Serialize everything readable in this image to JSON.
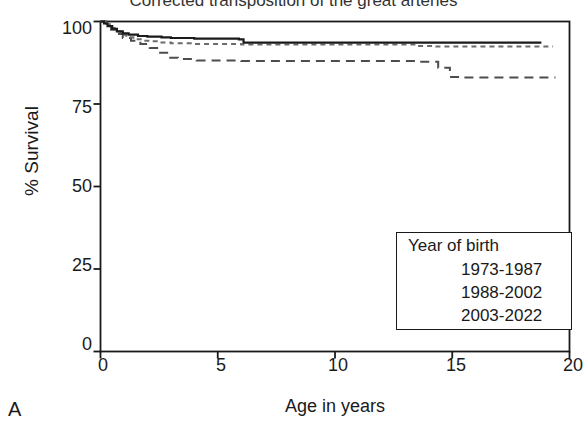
{
  "figure": {
    "panel_label": "A",
    "title": "Corrected transposition of the great arteries"
  },
  "chart_data": {
    "type": "line",
    "title": "Corrected transposition of the great arteries",
    "subtype": "kaplan-meier-survival",
    "xlabel": "Age in years",
    "ylabel": "% Survival",
    "xlim": [
      0,
      20
    ],
    "ylim": [
      0,
      100
    ],
    "xticks": [
      0,
      5,
      10,
      15,
      20
    ],
    "yticks": [
      0,
      25,
      50,
      75,
      100
    ],
    "xtick_labels": [
      "0",
      "5",
      "10",
      "15",
      "20"
    ],
    "ytick_labels": [
      "0",
      "25",
      "50",
      "75",
      "100"
    ],
    "grid": false,
    "legend_position": "lower right",
    "legend_title": "Year of birth",
    "series": [
      {
        "name": "1973-1987",
        "style": "long-dash",
        "color": "#4d4d4d",
        "points": [
          [
            0.0,
            100.0
          ],
          [
            0.25,
            99.0
          ],
          [
            0.45,
            97.5
          ],
          [
            0.7,
            96.2
          ],
          [
            0.95,
            95.0
          ],
          [
            1.3,
            94.2
          ],
          [
            1.7,
            93.2
          ],
          [
            2.1,
            92.0
          ],
          [
            2.5,
            90.5
          ],
          [
            2.9,
            89.0
          ],
          [
            3.3,
            88.6
          ],
          [
            4.1,
            88.2
          ],
          [
            6.0,
            88.0
          ],
          [
            10.0,
            88.0
          ],
          [
            13.6,
            87.8
          ],
          [
            14.4,
            86.0
          ],
          [
            14.9,
            83.2
          ],
          [
            15.3,
            83.0
          ],
          [
            19.4,
            83.0
          ]
        ]
      },
      {
        "name": "1988-2002",
        "style": "short-dash",
        "color": "#6b6b6b",
        "points": [
          [
            0.0,
            100.0
          ],
          [
            0.2,
            99.2
          ],
          [
            0.4,
            98.0
          ],
          [
            0.6,
            97.0
          ],
          [
            0.85,
            96.0
          ],
          [
            1.1,
            95.2
          ],
          [
            1.4,
            94.6
          ],
          [
            1.8,
            94.2
          ],
          [
            2.2,
            94.0
          ],
          [
            2.6,
            93.6
          ],
          [
            3.0,
            93.4
          ],
          [
            4.0,
            93.2
          ],
          [
            6.0,
            93.0
          ],
          [
            9.0,
            93.0
          ],
          [
            13.5,
            92.6
          ],
          [
            14.2,
            92.4
          ],
          [
            19.3,
            92.4
          ]
        ]
      },
      {
        "name": "2003-2022",
        "style": "solid",
        "color": "#1a1a1a",
        "points": [
          [
            0.0,
            100.0
          ],
          [
            0.15,
            99.4
          ],
          [
            0.3,
            98.6
          ],
          [
            0.5,
            97.8
          ],
          [
            0.7,
            97.0
          ],
          [
            0.95,
            96.4
          ],
          [
            1.2,
            96.0
          ],
          [
            1.6,
            95.6
          ],
          [
            2.0,
            95.4
          ],
          [
            2.6,
            95.2
          ],
          [
            3.0,
            95.0
          ],
          [
            4.0,
            94.8
          ],
          [
            5.9,
            94.6
          ],
          [
            6.1,
            93.6
          ],
          [
            10.0,
            93.6
          ],
          [
            14.0,
            93.6
          ],
          [
            18.8,
            93.6
          ]
        ]
      }
    ]
  },
  "legend": {
    "title": "Year of birth",
    "entries": [
      {
        "label": "1973-1987",
        "style": "long-dash"
      },
      {
        "label": "1988-2002",
        "style": "short-dash"
      },
      {
        "label": "2003-2022",
        "style": "solid"
      }
    ]
  },
  "axes": {
    "x_label": "Age in years",
    "y_label": "% Survival",
    "x_ticks": [
      "0",
      "5",
      "10",
      "15",
      "20"
    ],
    "y_ticks": [
      "100",
      "75",
      "50",
      "25",
      "0"
    ]
  },
  "colors": {
    "axis": "#1a1a1a",
    "series_solid": "#1a1a1a",
    "series_long_dash": "#4d4d4d",
    "series_short_dash": "#6b6b6b",
    "background": "#ffffff"
  }
}
